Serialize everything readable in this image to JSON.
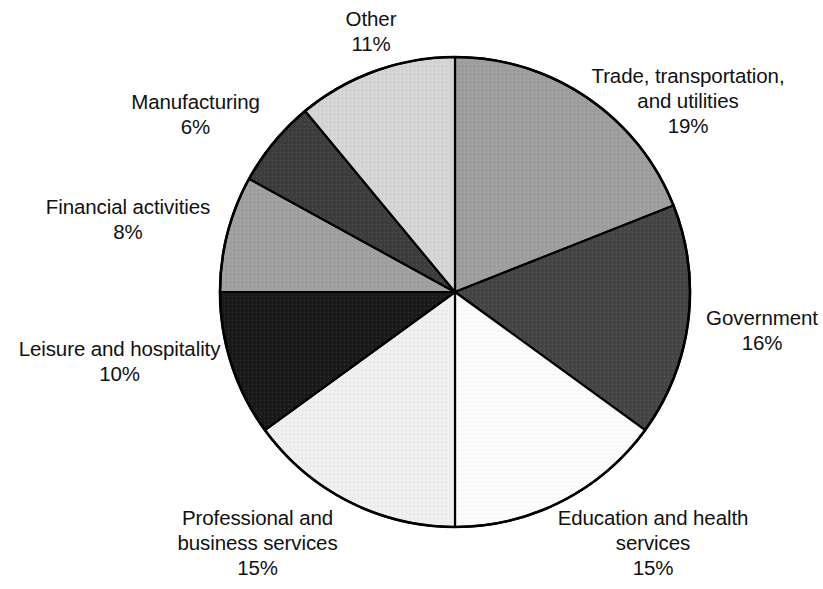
{
  "chart_data": {
    "type": "pie",
    "title": "",
    "subtitle": "",
    "xlabel": "",
    "ylabel": "",
    "legend_position": "none",
    "grid": false,
    "start_angle_deg": 0,
    "direction": "clockwise",
    "unit": "%",
    "categories": [
      "Trade, transportation, and utilities",
      "Government",
      "Education and health services",
      "Professional and business services",
      "Leisure and hospitality",
      "Financial activities",
      "Manufacturing",
      "Other"
    ],
    "values": [
      19,
      16,
      15,
      15,
      10,
      8,
      6,
      11
    ],
    "total": 100,
    "slices": [
      {
        "id": "trade",
        "label_lines": [
          "Trade, transportation,",
          "and utilities"
        ],
        "value_label": "19%",
        "value": 19,
        "color": "#9e9e9e"
      },
      {
        "id": "government",
        "label_lines": [
          "Government"
        ],
        "value_label": "16%",
        "value": 16,
        "color": "#454545"
      },
      {
        "id": "education",
        "label_lines": [
          "Education and health",
          "services"
        ],
        "value_label": "15%",
        "value": 15,
        "color": "#fcfcfc"
      },
      {
        "id": "professional",
        "label_lines": [
          "Professional and",
          "business services"
        ],
        "value_label": "15%",
        "value": 15,
        "color": "#efefef"
      },
      {
        "id": "leisure",
        "label_lines": [
          "Leisure and hospitality"
        ],
        "value_label": "10%",
        "value": 10,
        "color": "#1a1a1a"
      },
      {
        "id": "financial",
        "label_lines": [
          "Financial activities"
        ],
        "value_label": "8%",
        "value": 8,
        "color": "#a0a0a0"
      },
      {
        "id": "manufacturing",
        "label_lines": [
          "Manufacturing"
        ],
        "value_label": "6%",
        "value": 6,
        "color": "#3d3d3d"
      },
      {
        "id": "other",
        "label_lines": [
          "Other"
        ],
        "value_label": "11%",
        "value": 11,
        "color": "#d5d5d5"
      }
    ],
    "outline_color": "#000000",
    "background_color": "#ffffff"
  },
  "labels": {
    "trade": {
      "line1": "Trade, transportation,",
      "line2": "and utilities",
      "value": "19%"
    },
    "government": {
      "line1": "Government",
      "value": "16%"
    },
    "education": {
      "line1": "Education and health",
      "line2": "services",
      "value": "15%"
    },
    "professional": {
      "line1": "Professional and",
      "line2": "business services",
      "value": "15%"
    },
    "leisure": {
      "line1": "Leisure and hospitality",
      "value": "10%"
    },
    "financial": {
      "line1": "Financial activities",
      "value": "8%"
    },
    "manufacturing": {
      "line1": "Manufacturing",
      "value": "6%"
    },
    "other": {
      "line1": "Other",
      "value": "11%"
    }
  }
}
